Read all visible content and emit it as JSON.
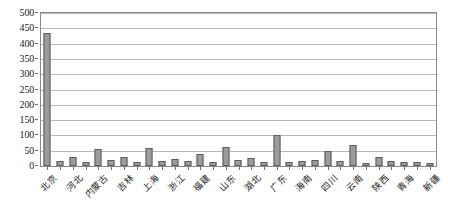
{
  "chart_data": {
    "type": "bar",
    "title": "",
    "subtitle": "",
    "xlabel": "",
    "ylabel": "",
    "ylim": [
      0,
      500
    ],
    "ytick_step": 50,
    "grid": true,
    "legend": false,
    "legend_position": "none",
    "bar_color": "#9c9c9c",
    "bar_border_color": "#5d5d5d",
    "axis_color": "#8a8a8a",
    "grid_color": "#b9b9b9",
    "label_rotation": -45,
    "yticks": [
      "0",
      "50",
      "100",
      "150",
      "200",
      "250",
      "300",
      "350",
      "400",
      "450",
      "500"
    ],
    "categories": [
      "北京",
      "天津",
      "河北",
      "山西",
      "内蒙古",
      "辽宁",
      "吉林",
      "黑龙江",
      "上海",
      "江苏",
      "浙江",
      "安徽",
      "福建",
      "江西",
      "山东",
      "河南",
      "湖北",
      "湖南",
      "广东",
      "广西",
      "海南",
      "重庆",
      "四川",
      "贵州",
      "云南",
      "西藏",
      "陕西",
      "甘肃",
      "青海",
      "宁夏",
      "新疆"
    ],
    "labeled_categories": [
      "北京",
      "河北",
      "内蒙古",
      "吉林",
      "上海",
      "浙江",
      "福建",
      "山东",
      "湖北",
      "广东",
      "海南",
      "四川",
      "云南",
      "陕西",
      "青海",
      "新疆"
    ],
    "values": [
      435,
      18,
      30,
      14,
      55,
      20,
      28,
      13,
      60,
      16,
      22,
      18,
      40,
      14,
      62,
      20,
      27,
      13,
      100,
      12,
      18,
      20,
      48,
      15,
      70,
      10,
      30,
      18,
      14,
      12,
      10
    ]
  }
}
